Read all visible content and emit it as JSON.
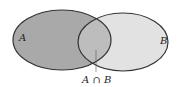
{
  "diagram": {
    "type": "venn",
    "sets": [
      {
        "id": "A",
        "label": "A",
        "fill": "#a9a9a9"
      },
      {
        "id": "B",
        "label": "B",
        "fill": "#e2e2e2"
      }
    ],
    "intersection": {
      "label": "A ∩ B",
      "fill": "#bdbdbd"
    },
    "stroke": "#333333"
  }
}
